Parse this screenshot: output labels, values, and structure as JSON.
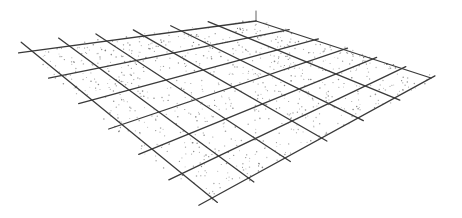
{
  "diagram": {
    "type": "perspective-grid-plane",
    "corners": {
      "top": [
        256,
        21
      ],
      "left": [
        32,
        51
      ],
      "right": [
        431,
        78
      ],
      "bottom": [
        212,
        198
      ]
    },
    "divisions_u": 6,
    "divisions_v": 6,
    "overshoot": 0.06,
    "apex_tick": {
      "from": [
        256,
        21
      ],
      "to": [
        256,
        11
      ]
    },
    "dot_count": 900,
    "colors": {
      "line": "#3a3a3a",
      "dot": "#777777",
      "background": "#ffffff"
    }
  }
}
